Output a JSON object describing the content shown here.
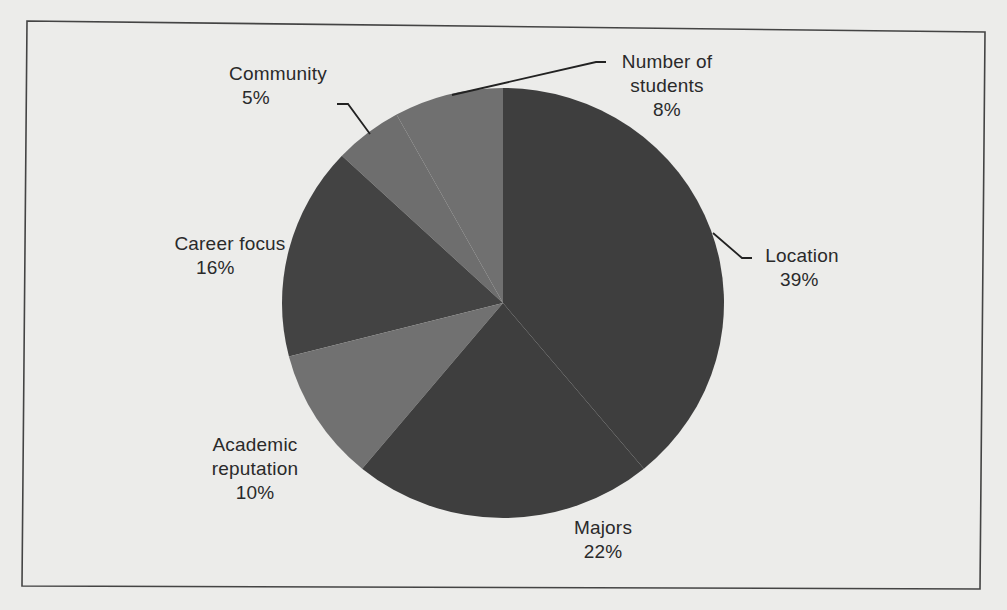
{
  "chart_data": {
    "type": "pie",
    "title": "",
    "start_angle": "12 o'clock",
    "direction": "counter-clockwise from top: Number of students, Community, Career focus, Academic reputation, Majors, Location",
    "categories": [
      "Location",
      "Majors",
      "Academic reputation",
      "Career focus",
      "Community",
      "Number of students"
    ],
    "values": [
      39,
      22,
      10,
      16,
      5,
      8
    ],
    "unit": "%",
    "legend": "none (data labels with leader lines)",
    "colors": {
      "Location": "#3e3e3e",
      "Majors": "#3e3e3e",
      "Academic reputation": "#717171",
      "Career focus": "#434343",
      "Community": "#6e6e6e",
      "Number of students": "#707070"
    }
  },
  "labels": {
    "location": {
      "name": "Location",
      "pct": "39%"
    },
    "majors": {
      "name": "Majors",
      "pct": "22%"
    },
    "academic": {
      "name1": "Academic",
      "name2": "reputation",
      "pct": "10%"
    },
    "career": {
      "name": "Career focus",
      "pct": "16%"
    },
    "community": {
      "name": "Community",
      "pct": "5%"
    },
    "students": {
      "name1": "Number of",
      "name2": "students",
      "pct": "8%"
    }
  }
}
